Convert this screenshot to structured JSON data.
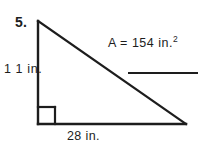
{
  "figure": {
    "problem_number": "5.",
    "height_label": "1 1 in.",
    "base_label": "28 in.",
    "area_label": "A = 154 in.",
    "area_exponent": "2",
    "ink_color": "#1d1d1d",
    "background_color": "#ffffff"
  },
  "geometry": {
    "shape": "right-triangle",
    "apex": {
      "x": 38,
      "y": 21
    },
    "right_angle_vertex": {
      "x": 38,
      "y": 124
    },
    "base_end": {
      "x": 186,
      "y": 124
    },
    "right_angle_marker_size": 17,
    "answer_blank": {
      "x1": 128,
      "y": 73,
      "x2": 198
    }
  }
}
